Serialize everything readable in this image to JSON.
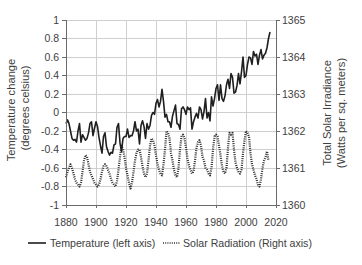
{
  "chart_data": {
    "type": "line",
    "title": "",
    "xlabel": "",
    "ylabel": "Temperature change (degrees celsius)",
    "ylabel_lines": [
      "Temperature change",
      "(degrees celsius)"
    ],
    "ylabel_right": "Total Solar Irradiance (Watts per sq. meters)",
    "ylabel_right_lines": [
      "Total Solar Irradiance",
      "(Watts per sq. meters)"
    ],
    "xlim": [
      1880,
      2020
    ],
    "ylim": [
      -1,
      1
    ],
    "ylim_right": [
      1360,
      1365
    ],
    "grid": true,
    "legend_position": "bottom",
    "x_ticks": [
      1880,
      1900,
      1920,
      1940,
      1960,
      1980,
      2000,
      2020
    ],
    "x_tick_labels": [
      "1880",
      "1900",
      "1920",
      "1940",
      "1960",
      "1980",
      "2000",
      "2020"
    ],
    "y_ticks_left": [
      1,
      0.8,
      0.6,
      0.4,
      0.2,
      0,
      -0.2,
      -0.4,
      -0.6,
      -0.8,
      -1
    ],
    "y_tick_labels_left": [
      "1",
      "0.8",
      "0.6",
      "0.4",
      "0.2",
      "0",
      "-0.2",
      "-0.4",
      "-0.6",
      "-0.8",
      "-1"
    ],
    "y_ticks_right": [
      1365,
      1364,
      1363,
      1362,
      1361,
      1360
    ],
    "y_tick_labels_right": [
      "1365",
      "1364",
      "1363",
      "1362",
      "1361",
      "1360"
    ],
    "series": [
      {
        "name": "Temperature (left axis)",
        "axis": "left",
        "style": "solid",
        "color": "#1f1f1f",
        "x_start": 1880,
        "x_step": 1,
        "values": [
          -0.12,
          -0.08,
          -0.12,
          -0.2,
          -0.28,
          -0.3,
          -0.29,
          -0.32,
          -0.2,
          -0.12,
          -0.32,
          -0.24,
          -0.27,
          -0.3,
          -0.28,
          -0.22,
          -0.12,
          -0.1,
          -0.25,
          -0.17,
          -0.1,
          -0.15,
          -0.27,
          -0.36,
          -0.44,
          -0.26,
          -0.22,
          -0.37,
          -0.42,
          -0.46,
          -0.43,
          -0.44,
          -0.35,
          -0.34,
          -0.16,
          -0.12,
          -0.33,
          -0.42,
          -0.28,
          -0.26,
          -0.26,
          -0.18,
          -0.27,
          -0.25,
          -0.25,
          -0.2,
          -0.1,
          -0.2,
          -0.18,
          -0.34,
          -0.14,
          -0.09,
          -0.15,
          -0.28,
          -0.12,
          -0.18,
          -0.14,
          -0.03,
          0.0,
          -0.02,
          0.1,
          0.14,
          0.06,
          0.12,
          0.25,
          0.12,
          -0.05,
          -0.02,
          -0.1,
          -0.1,
          -0.16,
          -0.04,
          0.02,
          0.08,
          -0.12,
          -0.13,
          -0.18,
          0.04,
          0.06,
          0.03,
          -0.02,
          0.06,
          0.03,
          0.05,
          -0.18,
          -0.1,
          -0.05,
          -0.01,
          -0.06,
          0.06,
          0.03,
          -0.07,
          0.01,
          0.15,
          -0.06,
          0.0,
          -0.09,
          0.17,
          0.07,
          0.15,
          0.26,
          0.3,
          0.13,
          0.3,
          0.15,
          0.12,
          0.18,
          0.3,
          0.36,
          0.26,
          0.42,
          0.38,
          0.21,
          0.22,
          0.29,
          0.42,
          0.31,
          0.44,
          0.6,
          0.38,
          0.4,
          0.52,
          0.6,
          0.59,
          0.52,
          0.66,
          0.61,
          0.63,
          0.52,
          0.62,
          0.68,
          0.58,
          0.62,
          0.64,
          0.7,
          0.8,
          0.87
        ]
      },
      {
        "name": "Solar Radiation (Right axis)",
        "axis": "right",
        "style": "dotted",
        "color": "#2e2e2e",
        "x_start": 1880,
        "x_step": 1,
        "values": [
          1360.75,
          1360.9,
          1361.0,
          1361.1,
          1361.0,
          1360.85,
          1360.7,
          1360.6,
          1360.55,
          1360.5,
          1360.6,
          1360.9,
          1361.2,
          1361.35,
          1361.3,
          1361.1,
          1360.9,
          1360.8,
          1360.7,
          1360.6,
          1360.55,
          1360.5,
          1360.55,
          1360.7,
          1360.9,
          1361.05,
          1361.1,
          1361.05,
          1360.95,
          1360.85,
          1360.7,
          1360.6,
          1360.55,
          1360.5,
          1360.65,
          1360.95,
          1361.3,
          1361.6,
          1361.5,
          1361.3,
          1361.0,
          1360.8,
          1360.6,
          1360.45,
          1360.6,
          1360.9,
          1361.2,
          1361.4,
          1361.5,
          1361.5,
          1361.3,
          1361.05,
          1360.85,
          1360.75,
          1360.85,
          1361.2,
          1361.6,
          1361.8,
          1361.75,
          1361.6,
          1361.35,
          1361.1,
          1360.95,
          1360.85,
          1360.8,
          1361.1,
          1361.5,
          1362.0,
          1361.95,
          1361.8,
          1361.4,
          1361.2,
          1360.95,
          1360.8,
          1360.75,
          1361.0,
          1361.5,
          1361.85,
          1361.9,
          1361.8,
          1361.55,
          1361.25,
          1361.05,
          1360.95,
          1360.85,
          1360.9,
          1361.2,
          1361.55,
          1361.7,
          1361.75,
          1361.6,
          1361.3,
          1361.2,
          1361.0,
          1360.95,
          1360.85,
          1360.8,
          1361.0,
          1361.5,
          1361.85,
          1361.9,
          1361.85,
          1361.6,
          1361.35,
          1361.05,
          1360.9,
          1360.85,
          1361.0,
          1361.55,
          1361.95,
          1361.9,
          1361.95,
          1361.5,
          1361.15,
          1361.0,
          1360.9,
          1360.85,
          1360.95,
          1361.4,
          1361.75,
          1362.0,
          1361.95,
          1361.85,
          1361.4,
          1361.1,
          1360.95,
          1360.8,
          1360.7,
          1360.55,
          1360.5,
          1360.7,
          1361.0,
          1361.2,
          1361.3,
          1361.45,
          1361.2
        ]
      }
    ]
  },
  "legend": {
    "temperature_label": "Temperature (left axis)",
    "solar_label": "Solar Radiation (Right axis)"
  }
}
